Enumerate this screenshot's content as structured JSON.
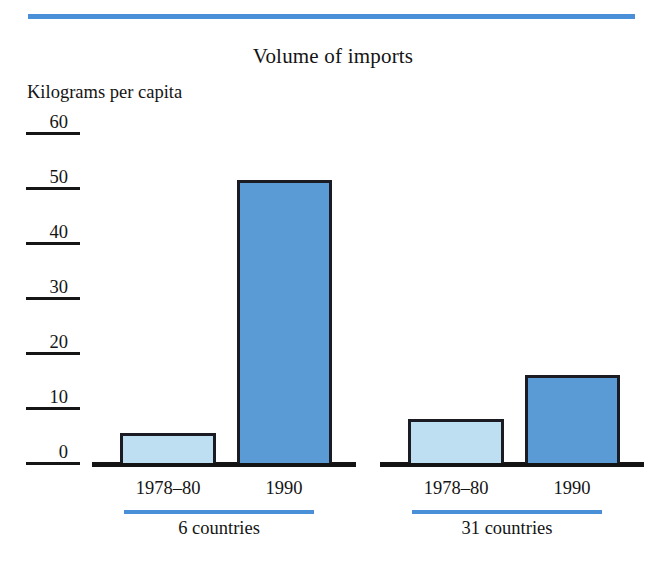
{
  "chart_data": {
    "type": "bar",
    "title": "Volume of imports",
    "ylabel": "Kilograms per capita",
    "xlabel": "",
    "ylim": [
      0,
      60
    ],
    "yticks": [
      0,
      10,
      20,
      30,
      40,
      50,
      60
    ],
    "ytick_labels": [
      "0",
      "10",
      "20",
      "30",
      "40",
      "50",
      "60"
    ],
    "grid": false,
    "legend": false,
    "categories": [
      "1978–80",
      "1990"
    ],
    "groups": [
      {
        "name": "6 countries",
        "bars": [
          {
            "category": "1978–80",
            "value": 5.5,
            "color": "#BEDFF2"
          },
          {
            "category": "1990",
            "value": 51.5,
            "color": "#5B9BD5"
          }
        ]
      },
      {
        "name": "31 countries",
        "bars": [
          {
            "category": "1978–80",
            "value": 8.0,
            "color": "#BEDFF2"
          },
          {
            "category": "1990",
            "value": 16.0,
            "color": "#5B9BD5"
          }
        ]
      }
    ],
    "series": [
      {
        "name": "1978–80",
        "values": [
          5.5,
          8.0
        ],
        "color": "#BEDFF2"
      },
      {
        "name": "1990",
        "values": [
          51.5,
          16.0
        ],
        "color": "#5B9BD5"
      }
    ],
    "colors": {
      "accent_rule": "#4A90D9",
      "bar_light": "#BEDFF2",
      "bar_dark": "#5B9BD5",
      "outline": "#1b1b23",
      "text": "#141414"
    }
  }
}
